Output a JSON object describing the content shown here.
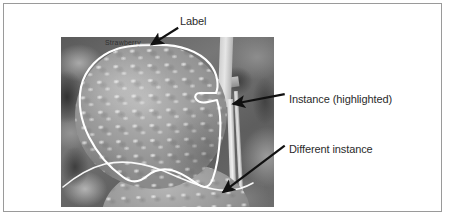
{
  "figure": {
    "frame_border_color": "#9a9a9a",
    "background_color": "#ffffff"
  },
  "photo": {
    "subject": "strawberry",
    "style": "grayscale photograph",
    "stamp_text": "Strawberry",
    "contour_color": "#ffffff",
    "contour_name": "instance-outline"
  },
  "annotations": [
    {
      "id": "label",
      "text": "Label",
      "arrow_from": "text",
      "arrow_to": "instance-outline-top",
      "arrow_color": "#111111"
    },
    {
      "id": "instance-highlighted",
      "text": "Instance (highlighted)",
      "arrow_from": "text",
      "arrow_to": "instance-outline-right",
      "arrow_color": "#111111"
    },
    {
      "id": "different-instance",
      "text": "Different instance",
      "arrow_from": "text",
      "arrow_to": "second-berry",
      "arrow_color": "#111111"
    }
  ],
  "colors": {
    "text": "#2b2b2b",
    "arrow": "#111111",
    "outline": "#ffffff",
    "frame": "#9a9a9a"
  }
}
